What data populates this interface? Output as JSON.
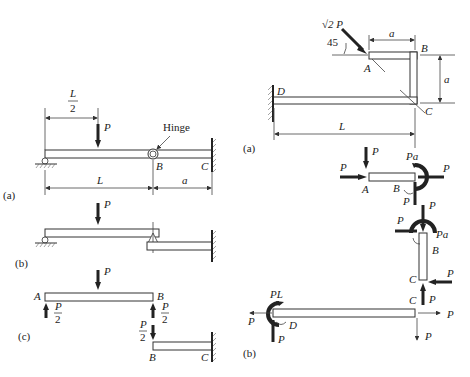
{
  "left_figure": {
    "subfigure_a": {
      "label": "(a)",
      "load": "P",
      "half_span_num": "L",
      "half_span_den": "2",
      "hinge_label": "Hinge",
      "point_B": "B",
      "point_C": "C",
      "span_L": "L",
      "span_a": "a"
    },
    "subfigure_b": {
      "label": "(b)",
      "load": "P"
    },
    "subfigure_c": {
      "label": "(c)",
      "load": "P",
      "point_A": "A",
      "point_B_top": "B",
      "point_B_bottom": "B",
      "point_C": "C",
      "reaction_num": "P",
      "reaction_den": "2"
    }
  },
  "right_figure": {
    "subfigure_a": {
      "label": "(a)",
      "load": "√2 P",
      "angle": "45",
      "point_A": "A",
      "point_B": "B",
      "point_C": "C",
      "point_D": "D",
      "dim_a_horizontal": "a",
      "dim_a_vertical": "a",
      "dim_L": "L"
    },
    "subfigure_b": {
      "label": "(b)",
      "segment_AB": {
        "force": "P",
        "moment": "Pa",
        "point_A": "A",
        "point_B": "B"
      },
      "segment_BC": {
        "force": "P",
        "moment": "Pa",
        "point_B": "B",
        "point_C": "C"
      },
      "segment_CD": {
        "force": "P",
        "moment": "PL",
        "point_C": "C",
        "point_D": "D"
      }
    }
  }
}
